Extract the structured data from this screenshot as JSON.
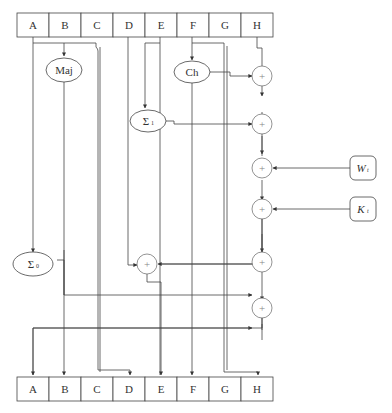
{
  "diagram": {
    "title": "",
    "top_registers": [
      "A",
      "B",
      "C",
      "D",
      "E",
      "F",
      "G",
      "H"
    ],
    "bottom_registers": [
      "A",
      "B",
      "C",
      "D",
      "E",
      "F",
      "G",
      "H"
    ],
    "functions": {
      "maj": "Maj",
      "ch": "Ch",
      "sigma1": "Σ",
      "sigma1_sub": "1",
      "sigma0": "Σ",
      "sigma0_sub": "0"
    },
    "inputs": {
      "w": "W",
      "w_sub": "t",
      "k": "K",
      "k_sub": "t"
    },
    "adder_symbol": "+",
    "line_color": "#444444"
  }
}
